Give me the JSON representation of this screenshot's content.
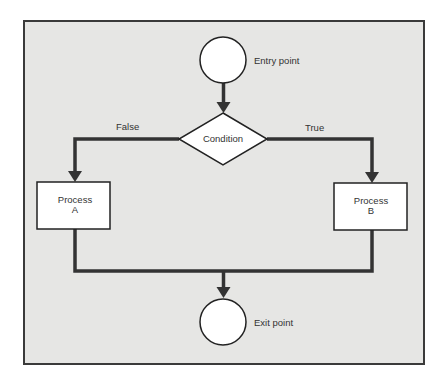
{
  "diagram": {
    "type": "flowchart",
    "colors": {
      "background": "#e6e6e4",
      "frame": "#3a3a3a",
      "connector": "#333333",
      "node_fill": "#ffffff",
      "text": "#333333"
    },
    "nodes": {
      "entry": {
        "shape": "circle",
        "label": "Entry point"
      },
      "condition": {
        "shape": "diamond",
        "label": "Condition"
      },
      "process_a": {
        "shape": "rectangle",
        "line1": "Process",
        "line2": "A"
      },
      "process_b": {
        "shape": "rectangle",
        "line1": "Process",
        "line2": "B"
      },
      "exit": {
        "shape": "circle",
        "label": "Exit point"
      }
    },
    "edges": {
      "false_label": "False",
      "true_label": "True"
    }
  }
}
